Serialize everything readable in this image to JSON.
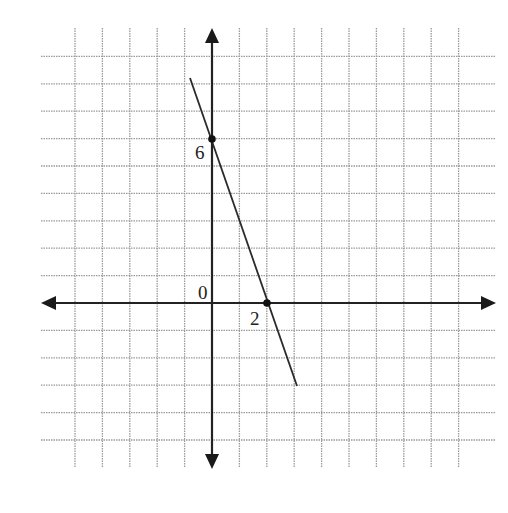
{
  "chart_data": {
    "type": "line",
    "title": "",
    "xlabel": "",
    "ylabel": "",
    "grid": true,
    "xlim": [
      -6,
      10
    ],
    "ylim": [
      -6,
      10
    ],
    "series": [
      {
        "name": "line",
        "x": [
          -0.8,
          3.1
        ],
        "y": [
          8.3,
          -3.0
        ],
        "equation": "y = -3x + 6"
      }
    ],
    "points": [
      {
        "x": 0,
        "y": 6,
        "label": "6"
      },
      {
        "x": 2,
        "y": 0,
        "label": "2"
      }
    ],
    "annotations": [
      {
        "text": "0",
        "x": 0,
        "y": 0
      },
      {
        "text": "6",
        "x": 0,
        "y": 6
      },
      {
        "text": "2",
        "x": 2,
        "y": 0
      }
    ]
  },
  "labels": {
    "origin": "0",
    "y_intercept": "6",
    "x_intercept": "2"
  },
  "colors": {
    "grid": "#9a9a9a",
    "axis": "#222222",
    "line": "#2a2a2a"
  }
}
